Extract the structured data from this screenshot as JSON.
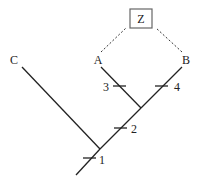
{
  "diagram": {
    "type": "cladogram",
    "taxa": [
      {
        "id": "C",
        "label": "C"
      },
      {
        "id": "A",
        "label": "A"
      },
      {
        "id": "B",
        "label": "B"
      }
    ],
    "hypothetical_ancestor": {
      "label": "Z",
      "connected_to": [
        "A",
        "B"
      ],
      "style": "dashed"
    },
    "character_ticks": [
      {
        "label": "1",
        "branch": "root"
      },
      {
        "label": "2",
        "branch": "AB-stem"
      },
      {
        "label": "3",
        "branch": "A"
      },
      {
        "label": "4",
        "branch": "B"
      }
    ],
    "colors": {
      "line": "#222222",
      "box": "#555555",
      "background": "#ffffff"
    }
  }
}
